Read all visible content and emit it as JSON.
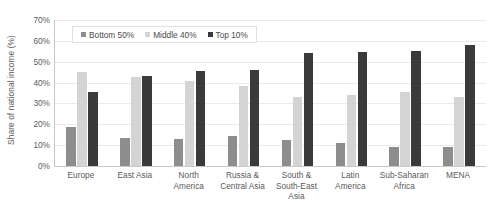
{
  "chart_data": {
    "type": "bar",
    "title": "",
    "subtitle": "",
    "xlabel": "",
    "ylabel": "Share of national income (%)",
    "ylim": [
      0,
      70
    ],
    "ytick_labels": [
      "70%",
      "60%",
      "50%",
      "40%",
      "30%",
      "20%",
      "10%",
      "0%"
    ],
    "ytick_values": [
      70,
      60,
      50,
      40,
      30,
      20,
      10,
      0
    ],
    "grid": true,
    "legend_position": "top-left-inside",
    "categories": [
      "Europe",
      "East Asia",
      "North America",
      "Russia & Central Asia",
      "South & South-East Asia",
      "Latin America",
      "Sub-Saharan Africa",
      "MENA"
    ],
    "category_lines": [
      [
        "Europe"
      ],
      [
        "East Asia"
      ],
      [
        "North",
        "America"
      ],
      [
        "Russia &",
        "Central Asia"
      ],
      [
        "South &",
        "South-East",
        "Asia"
      ],
      [
        "Latin",
        "America"
      ],
      [
        "Sub-Saharan",
        "Africa"
      ],
      [
        "MENA"
      ]
    ],
    "series": [
      {
        "name": "Bottom 50%",
        "color": "#8d8d8d",
        "values": [
          18.5,
          13.5,
          13,
          14.5,
          12.5,
          11,
          9,
          9
        ]
      },
      {
        "name": "Middle 40%",
        "color": "#d4d4d4",
        "values": [
          45,
          42.5,
          41,
          38.5,
          33,
          34,
          35.5,
          33
        ]
      },
      {
        "name": "Top 10%",
        "color": "#3a3a3a",
        "values": [
          35.5,
          43,
          45.5,
          46,
          54,
          54.5,
          55,
          58
        ]
      }
    ]
  },
  "colors": {
    "background": "#ffffff",
    "axis": "#c8c8c8",
    "gridline": "#eaeaea",
    "text": "#5a5a5a",
    "legend_border": "#e0e0e0"
  }
}
